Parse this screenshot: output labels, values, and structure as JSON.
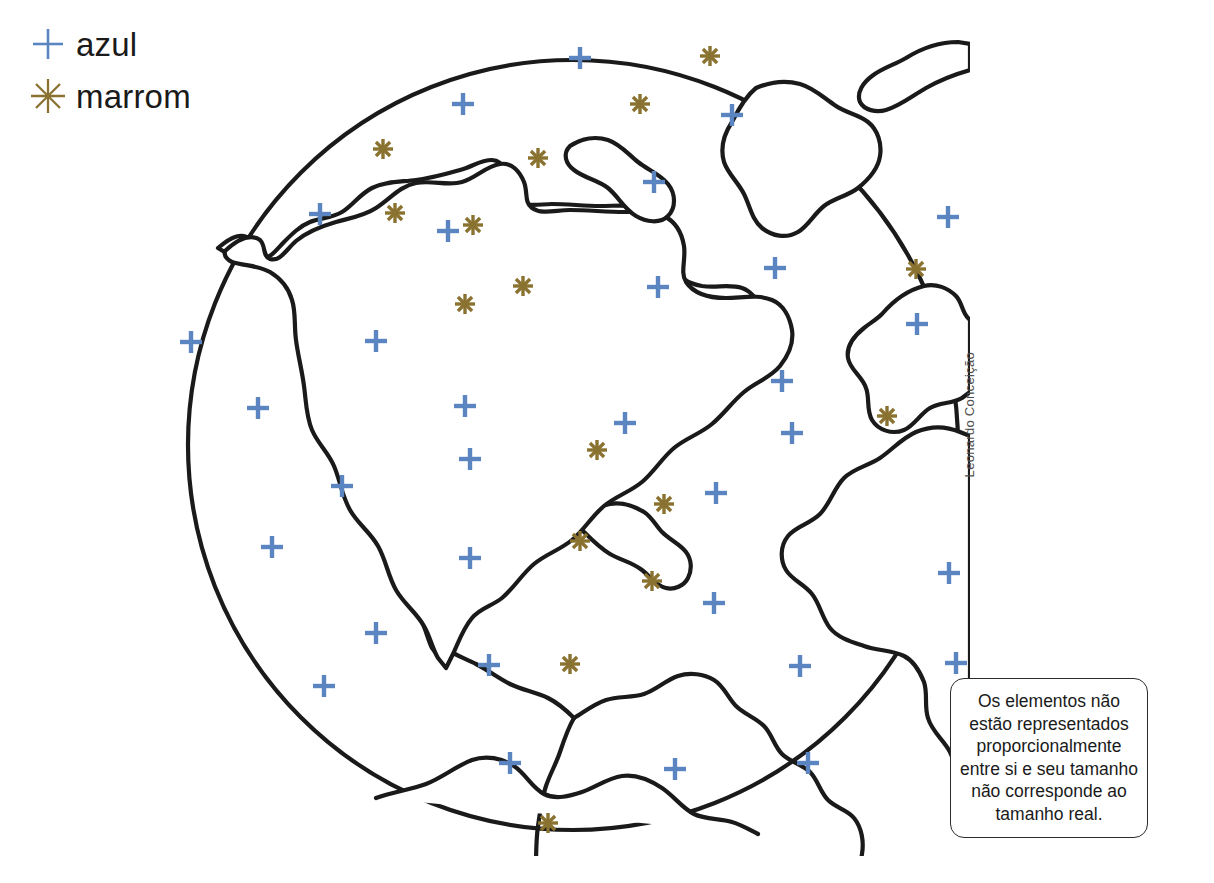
{
  "legend": {
    "items": [
      {
        "symbol": "plus-icon",
        "label": "azul",
        "color": "#5b85c0"
      },
      {
        "symbol": "asterisk-icon",
        "label": "marrom",
        "color": "#8a7230"
      }
    ]
  },
  "credit": {
    "text": "Leonardo Conceição"
  },
  "note": {
    "lines": [
      "Os elementos não",
      "estão representados",
      "proporcionalmente",
      "entre si e seu tamanho",
      "não corresponde ao",
      "tamanho real."
    ]
  },
  "globe": {
    "outline_color": "#1a1a1a",
    "fill_color": "#ffffff",
    "center": {
      "x": 393,
      "y": 409
    },
    "radius": 385
  },
  "map_data": {
    "type": "map",
    "projection": "orthographic-americas",
    "blue_symbol": {
      "name": "plus-icon",
      "legend": "azul",
      "color": "#5b85c0",
      "count": 34
    },
    "brown_symbol": {
      "name": "asterisk-icon",
      "legend": "marrom",
      "color": "#8a7230",
      "count": 18
    },
    "blue_points": [
      [
        400,
        22
      ],
      [
        283,
        68
      ],
      [
        552,
        79
      ],
      [
        474,
        146
      ],
      [
        140,
        178
      ],
      [
        268,
        195
      ],
      [
        768,
        181
      ],
      [
        595,
        232
      ],
      [
        478,
        251
      ],
      [
        11,
        306
      ],
      [
        196,
        305
      ],
      [
        737,
        288
      ],
      [
        602,
        345
      ],
      [
        817,
        260
      ],
      [
        285,
        370
      ],
      [
        445,
        387
      ],
      [
        78,
        372
      ],
      [
        612,
        397
      ],
      [
        536,
        457
      ],
      [
        92,
        511
      ],
      [
        290,
        423
      ],
      [
        162,
        450
      ],
      [
        290,
        522
      ],
      [
        879,
        497
      ],
      [
        534,
        567
      ],
      [
        769,
        537
      ],
      [
        196,
        597
      ],
      [
        309,
        629
      ],
      [
        144,
        650
      ],
      [
        620,
        630
      ],
      [
        776,
        627
      ],
      [
        330,
        727
      ],
      [
        495,
        733
      ],
      [
        628,
        727
      ]
    ],
    "brown_points": [
      [
        203,
        113
      ],
      [
        358,
        122
      ],
      [
        460,
        68
      ],
      [
        530,
        20
      ],
      [
        215,
        177
      ],
      [
        293,
        189
      ],
      [
        343,
        250
      ],
      [
        285,
        268
      ],
      [
        736,
        233
      ],
      [
        804,
        308
      ],
      [
        707,
        380
      ],
      [
        806,
        455
      ],
      [
        417,
        414
      ],
      [
        484,
        468
      ],
      [
        400,
        505
      ],
      [
        472,
        545
      ],
      [
        390,
        628
      ],
      [
        368,
        787
      ]
    ]
  }
}
